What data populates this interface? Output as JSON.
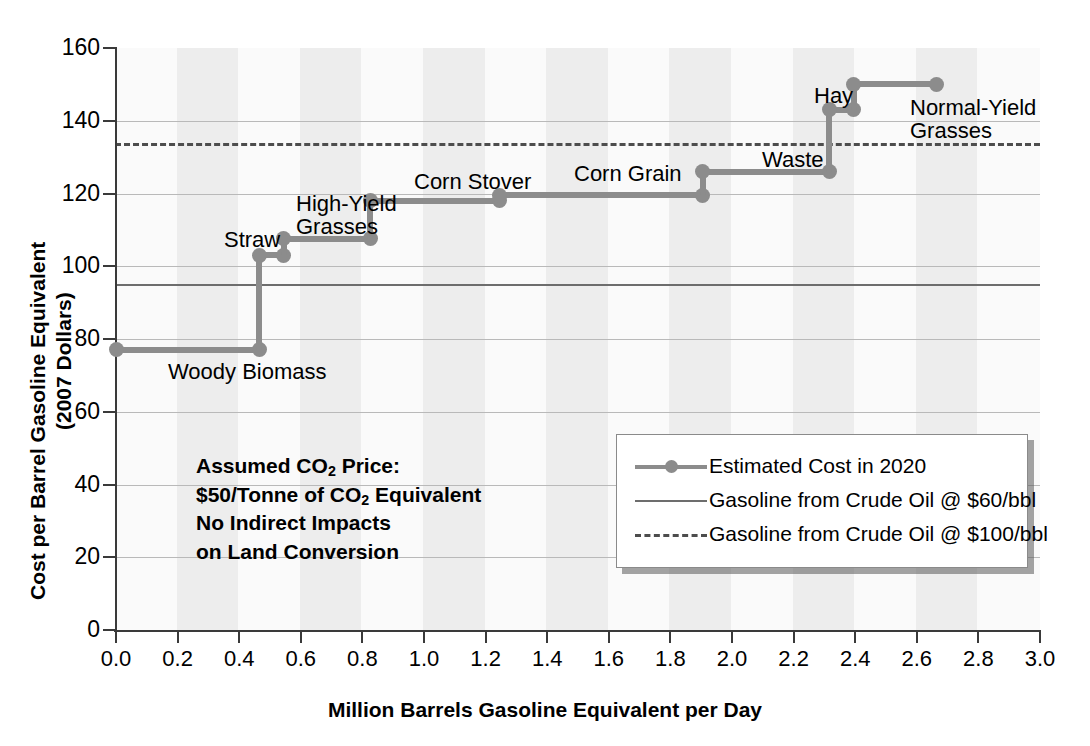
{
  "chart_data": {
    "type": "line",
    "title": "",
    "xlabel": "Million Barrels Gasoline Equivalent per Day",
    "ylabel_line1": "Cost per Barrel Gasoline Equivalent",
    "ylabel_line2": "(2007 Dollars)",
    "xlim": [
      0.0,
      3.0
    ],
    "ylim": [
      0,
      160
    ],
    "xticks": [
      "0.0",
      "0.2",
      "0.4",
      "0.6",
      "0.8",
      "1.0",
      "1.2",
      "1.4",
      "1.6",
      "1.8",
      "2.0",
      "2.2",
      "2.4",
      "2.6",
      "2.8",
      "3.0"
    ],
    "yticks": [
      "0",
      "20",
      "40",
      "60",
      "80",
      "100",
      "120",
      "140",
      "160"
    ],
    "grid": "horizontal",
    "legend_position": "inside-lower-right",
    "series": [
      {
        "name": "Estimated Cost in 2020",
        "type": "step",
        "steps": [
          {
            "label": "Woody Biomass",
            "x_start": 0.0,
            "x_end": 0.465,
            "cost": 77
          },
          {
            "label": "Straw",
            "x_start": 0.465,
            "x_end": 0.545,
            "cost": 103
          },
          {
            "label": "High-Yield\nGrasses",
            "x_start": 0.545,
            "x_end": 0.825,
            "cost": 107.5
          },
          {
            "label": "Corn Stover",
            "x_start": 0.825,
            "x_end": 1.245,
            "cost": 118
          },
          {
            "label": "Corn Grain",
            "x_start": 1.245,
            "x_end": 1.905,
            "cost": 119.5
          },
          {
            "label": "Waste",
            "x_start": 1.905,
            "x_end": 2.315,
            "cost": 126
          },
          {
            "label": "Hay",
            "x_start": 2.315,
            "x_end": 2.395,
            "cost": 143
          },
          {
            "label": "Normal-Yield\nGrasses",
            "x_start": 2.395,
            "x_end": 2.665,
            "cost": 150
          }
        ]
      }
    ],
    "reference_lines": [
      {
        "name": "Gasoline from Crude Oil @ $60/bbl",
        "value": 95,
        "style": "solid"
      },
      {
        "name": "Gasoline from Crude Oil @ $100/bbl",
        "value": 134,
        "style": "dashed"
      }
    ],
    "annotation": {
      "line1_a": "Assumed CO",
      "line1_sub": "2",
      "line1_b": " Price:",
      "line2_a": "$50/Tonne of CO",
      "line2_sub": "2",
      "line2_b": " Equivalent",
      "line3": "No Indirect Impacts",
      "line4": "on Land Conversion"
    },
    "legend": {
      "items": [
        {
          "label": "Estimated Cost in 2020",
          "key": "line-with-marker"
        },
        {
          "label": "Gasoline from Crude Oil @ $60/bbl",
          "key": "solid-line"
        },
        {
          "label": "Gasoline from Crude Oil @ $100/bbl",
          "key": "dashed-line"
        }
      ]
    },
    "colors": {
      "series": "#8c8c8c",
      "ref_solid": "#6d6d6d",
      "ref_dashed": "#4d4d4d",
      "grid": "#b9b9b9",
      "axis": "#3a3a3a",
      "plot_bg": "#fafafa",
      "band": "#ededed"
    },
    "point_labels": [
      {
        "text": "Woody Biomass",
        "x": 168,
        "y": 360
      },
      {
        "text": "Straw",
        "x": 224,
        "y": 228
      },
      {
        "text": "High-Yield\nGrasses",
        "x": 296,
        "y": 192
      },
      {
        "text": "Corn Stover",
        "x": 414,
        "y": 170
      },
      {
        "text": "Corn Grain",
        "x": 574,
        "y": 162
      },
      {
        "text": "Waste",
        "x": 762,
        "y": 148
      },
      {
        "text": "Hay",
        "x": 814,
        "y": 84
      },
      {
        "text": "Normal-Yield\nGrasses",
        "x": 910,
        "y": 96
      }
    ]
  }
}
